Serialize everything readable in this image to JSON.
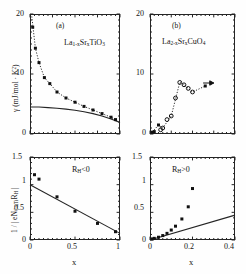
{
  "figure": {
    "panels": [
      {
        "id": "a",
        "label": "(a)",
        "material": "La1-xSrxTiO3",
        "ylabel": "γ (mJ/mol · K²)",
        "xlabel": "",
        "yticks": [
          "0",
          "10",
          "20"
        ],
        "xticks": []
      },
      {
        "id": "b",
        "label": "(b)",
        "material": "La2-xSrxCuO4",
        "ylabel": "",
        "xlabel": "",
        "yticks": [
          "0",
          "10",
          "20"
        ],
        "xticks": []
      },
      {
        "id": "c",
        "label": "",
        "annotation": "RH<0",
        "ylabel": "1 / | eNCa,Ti RH |",
        "xlabel": "x",
        "yticks": [
          "0",
          "0.5",
          "1",
          "1.5"
        ],
        "xticks": [
          "0",
          "0.5",
          "1"
        ]
      },
      {
        "id": "d",
        "label": "",
        "annotation": "RH>0",
        "ylabel": "",
        "xlabel": "x",
        "yticks": [
          "0",
          "0.5",
          "1",
          "1.5"
        ],
        "xticks": [
          "0",
          "0.2",
          "0.4"
        ]
      }
    ]
  },
  "chart_data": [
    {
      "type": "scatter",
      "panel": "a",
      "title": "(a)",
      "annotation": "La$_{1-x}$Sr$_x$TiO$_3$",
      "xlabel": "x",
      "ylabel": "γ (mJ/mol · K²)",
      "xlim": [
        0,
        1
      ],
      "ylim": [
        0,
        20
      ],
      "grid": false,
      "legend": "none",
      "series": [
        {
          "name": "gamma measured",
          "marker": "filled-square",
          "x": [
            0.03,
            0.06,
            0.1,
            0.16,
            0.22,
            0.3,
            0.4,
            0.5,
            0.6,
            0.7,
            0.8,
            0.9,
            0.95
          ],
          "y": [
            17.8,
            14.3,
            11.9,
            9.4,
            8.4,
            7.0,
            6.0,
            5.3,
            4.6,
            4.0,
            3.4,
            2.8,
            2.4
          ]
        },
        {
          "name": "dotted guide through data",
          "style": "dotted",
          "x": [
            0.02,
            0.06,
            0.1,
            0.16,
            0.22,
            0.3,
            0.4,
            0.5,
            0.6,
            0.7,
            0.8,
            0.9,
            0.97
          ],
          "y": [
            19.6,
            14.3,
            11.9,
            9.4,
            8.4,
            7.0,
            6.0,
            5.3,
            4.6,
            4.0,
            3.4,
            2.8,
            2.2
          ]
        },
        {
          "name": "band theory solid curve",
          "style": "solid",
          "x": [
            0.0,
            0.1,
            0.2,
            0.3,
            0.4,
            0.5,
            0.6,
            0.7,
            0.8,
            0.9,
            1.0
          ],
          "y": [
            4.5,
            4.5,
            4.4,
            4.3,
            4.15,
            3.95,
            3.7,
            3.4,
            3.0,
            2.5,
            1.9
          ]
        }
      ]
    },
    {
      "type": "scatter",
      "panel": "b",
      "title": "(b)",
      "annotation": "La$_{2-x}$Sr$_x$CuO$_4$",
      "xlabel": "x",
      "ylabel": "γ (mJ/mol · K²)",
      "xlim": [
        0,
        0.4
      ],
      "ylim": [
        0,
        20
      ],
      "grid": false,
      "legend": "none",
      "series": [
        {
          "name": "open circles",
          "marker": "open-circle",
          "x": [
            0.05,
            0.06,
            0.08,
            0.1,
            0.12,
            0.14,
            0.16,
            0.18,
            0.2
          ],
          "y": [
            0.7,
            1.0,
            2.4,
            3.0,
            6.0,
            8.6,
            8.2,
            7.6,
            7.0
          ]
        },
        {
          "name": "filled points",
          "marker": "filled-square",
          "x": [
            0.01,
            0.02,
            0.04,
            0.26
          ],
          "y": [
            0.3,
            0.4,
            1.5,
            8.0
          ]
        },
        {
          "name": "dotted guide",
          "style": "dotted",
          "x": [
            0.01,
            0.04,
            0.06,
            0.1,
            0.14,
            0.16,
            0.18,
            0.2,
            0.26
          ],
          "y": [
            0.3,
            1.5,
            1.0,
            3.0,
            8.6,
            8.2,
            7.6,
            7.0,
            8.0
          ]
        },
        {
          "name": "arrow annotation",
          "style": "arrow",
          "x": [
            0.25,
            0.3
          ],
          "y": [
            8.5,
            8.5
          ]
        }
      ]
    },
    {
      "type": "scatter",
      "panel": "c",
      "annotation": "R$_H$<0",
      "xlabel": "x",
      "ylabel": "1 / | eN$_{Ca,Ti}$R$_H$ |",
      "xlim": [
        0,
        1
      ],
      "ylim": [
        0,
        1.5
      ],
      "grid": false,
      "legend": "none",
      "series": [
        {
          "name": "inverse Hall data",
          "marker": "filled-square",
          "x": [
            0.05,
            0.1,
            0.3,
            0.5,
            0.75,
            0.95
          ],
          "y": [
            1.18,
            1.1,
            0.78,
            0.52,
            0.3,
            0.15
          ]
        },
        {
          "name": "linear fit",
          "style": "solid",
          "x": [
            0.0,
            1.0
          ],
          "y": [
            1.0,
            0.12
          ]
        }
      ]
    },
    {
      "type": "scatter",
      "panel": "d",
      "annotation": "R$_H$>0",
      "xlabel": "x",
      "ylabel": "1 / | eN$_{Ca,Ti}$R$_H$ |",
      "xlim": [
        0,
        0.4
      ],
      "ylim": [
        0,
        1.5
      ],
      "grid": false,
      "legend": "none",
      "series": [
        {
          "name": "inverse Hall data",
          "marker": "filled-square",
          "x": [
            0.01,
            0.02,
            0.04,
            0.06,
            0.08,
            0.1,
            0.12,
            0.15,
            0.18,
            0.2
          ],
          "y": [
            0.02,
            0.03,
            0.05,
            0.08,
            0.12,
            0.18,
            0.25,
            0.38,
            0.6,
            0.93
          ]
        },
        {
          "name": "linear fit",
          "style": "solid",
          "x": [
            0.0,
            0.4
          ],
          "y": [
            0.0,
            0.45
          ]
        }
      ]
    }
  ],
  "labels": {
    "gamma": "γ",
    "ylabel_a_unit": "(mJ/mol · K",
    "ylabel_a_exp": "2",
    "ylabel_a_close": ")",
    "ylabel_c_pre": "1 / | eN",
    "ylabel_c_sub": "Ca,Ti",
    "ylabel_c_mid": "R",
    "ylabel_c_sub2": "H",
    "ylabel_c_post": " |",
    "panel_a": "(a)",
    "panel_b": "(b)",
    "formula_a_1": "La",
    "formula_a_s1": "1-x",
    "formula_a_2": "Sr",
    "formula_a_s2": "x",
    "formula_a_3": "TiO",
    "formula_a_s3": "3",
    "formula_b_1": "La",
    "formula_b_s1": "2-x",
    "formula_b_2": "Sr",
    "formula_b_s2": "x",
    "formula_b_3": "CuO",
    "formula_b_s3": "4",
    "rh_neg_pre": "R",
    "rh_neg_sub": "H",
    "rh_neg_post": "<0",
    "rh_pos_pre": "R",
    "rh_pos_sub": "H",
    "rh_pos_post": ">0",
    "x_axis": "x",
    "t20": "20",
    "t10": "10",
    "t0": "0",
    "t15": "1.5",
    "t1": "1",
    "t05": "0.5",
    "tz": "0",
    "bx0": "0",
    "bx05": "0.5",
    "bx1": "1",
    "dx0": "0",
    "dx02": "0.2",
    "dx04": "0.4"
  },
  "colors": {
    "ink": "#1a1a1a",
    "axis": "#242424",
    "background": "#fefefe"
  }
}
